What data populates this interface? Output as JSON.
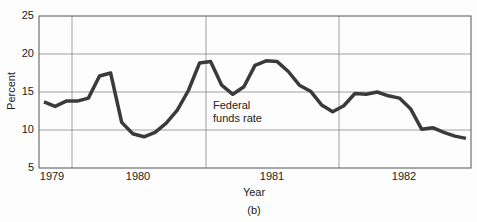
{
  "chart_data": {
    "type": "line",
    "title": "",
    "xlabel": "Year",
    "ylabel": "Percent",
    "caption": "(b)",
    "ylim": [
      5,
      25
    ],
    "yticks": [
      5,
      10,
      15,
      20,
      25
    ],
    "xticks": [
      "1979",
      "1980",
      "1981",
      "1982"
    ],
    "grid": true,
    "annotation": {
      "line1": "Federal",
      "line2": "funds rate"
    },
    "series": [
      {
        "name": "Federal funds rate",
        "x": [
          1979.04,
          1979.12,
          1979.2,
          1979.25,
          1979.32,
          1979.37,
          1979.45,
          1979.52,
          1979.6,
          1979.68,
          1979.76,
          1979.84,
          1979.9,
          1979.96,
          1980.04,
          1980.12,
          1980.2,
          1980.25,
          1980.33,
          1980.4,
          1980.48,
          1980.55,
          1980.63,
          1980.7,
          1980.78,
          1980.87,
          1980.95,
          1981.04,
          1981.12,
          1981.2,
          1981.28,
          1981.36,
          1981.44,
          1981.52,
          1981.6,
          1981.7,
          1981.8,
          1981.88,
          1981.96,
          1982.04,
          1982.12,
          1982.2,
          1982.3,
          1982.38,
          1982.46
        ],
        "values": [
          13.7,
          13.1,
          13.8,
          13.8,
          14.2,
          17.1,
          17.5,
          11.0,
          9.5,
          9.1,
          9.7,
          10.9,
          12.6,
          15.2,
          18.8,
          19.0,
          15.9,
          14.7,
          15.7,
          18.5,
          19.1,
          19.0,
          17.7,
          15.9,
          15.1,
          13.3,
          12.4,
          13.2,
          14.8,
          14.7,
          15.0,
          14.5,
          14.2,
          12.8,
          10.1,
          10.3,
          9.7,
          9.2,
          8.9,
          null,
          null,
          null,
          null,
          null,
          null
        ]
      }
    ]
  }
}
